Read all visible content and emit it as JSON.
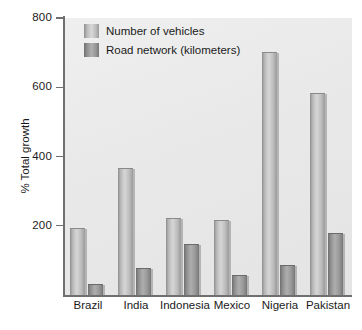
{
  "axes": {
    "y_title": "% Total growth",
    "y_ticks": [
      "800",
      "600",
      "400",
      "200"
    ]
  },
  "legend": {
    "items": [
      {
        "label": "Number of vehicles",
        "swatch": "light-gray-bar-swatch",
        "color": "#d6d6d6"
      },
      {
        "label": "Road network (kilometers)",
        "swatch": "dark-gray-bar-swatch",
        "color": "#989898"
      }
    ]
  },
  "chart_data": {
    "type": "bar",
    "title": "",
    "xlabel": "",
    "ylabel": "% Total growth",
    "ylim": [
      0,
      800
    ],
    "yticks": [
      0,
      200,
      400,
      600,
      800
    ],
    "grid": false,
    "legend_position": "top-left-inside",
    "categories": [
      "Brazil",
      "India",
      "Indonesia",
      "Mexico",
      "Nigeria",
      "Pakistan"
    ],
    "series": [
      {
        "name": "Number of vehicles",
        "values": [
          190,
          365,
          220,
          215,
          700,
          580
        ]
      },
      {
        "name": "Road network (kilometers)",
        "values": [
          30,
          75,
          145,
          55,
          85,
          175
        ]
      }
    ]
  }
}
